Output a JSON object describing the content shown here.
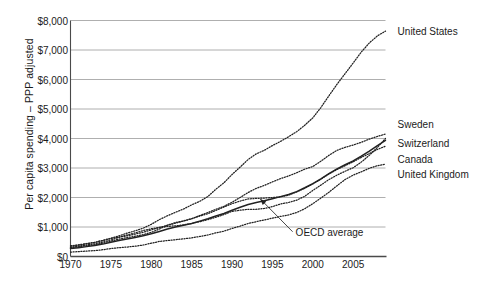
{
  "chart_data": {
    "type": "line",
    "title": "",
    "subtitle": "",
    "xlabel": "",
    "ylabel": "Per capita spending – PPP adjusted",
    "xlim": [
      1970,
      2009
    ],
    "ylim": [
      0,
      8000
    ],
    "grid": true,
    "legend_position": "right-inline-labels",
    "x_tick_labels": [
      "1970",
      "1975",
      "1980",
      "1985",
      "1990",
      "1995",
      "2000",
      "2005"
    ],
    "x_ticks": [
      1970,
      1975,
      1980,
      1985,
      1990,
      1995,
      2000,
      2005
    ],
    "y_tick_labels": [
      "$0",
      "$1,000",
      "$2,000",
      "$3,000",
      "$4,000",
      "$5,000",
      "$6,000",
      "$7,000",
      "$8,000"
    ],
    "y_ticks": [
      0,
      1000,
      2000,
      3000,
      4000,
      5000,
      6000,
      7000,
      8000
    ],
    "x": [
      1970,
      1971,
      1972,
      1973,
      1974,
      1975,
      1976,
      1977,
      1978,
      1979,
      1980,
      1981,
      1982,
      1983,
      1984,
      1985,
      1986,
      1987,
      1988,
      1989,
      1990,
      1991,
      1992,
      1993,
      1994,
      1995,
      1996,
      1997,
      1998,
      1999,
      2000,
      2001,
      2002,
      2003,
      2004,
      2005,
      2006,
      2007,
      2008,
      2009
    ],
    "annotations": [
      {
        "text": "OECD average",
        "target_x": 1993.5,
        "target_y": 1950,
        "label_x": 1997.5,
        "label_y": 840
      }
    ],
    "series": [
      {
        "name": "United States",
        "style": "dotted",
        "label_x": 2010.5,
        "label_y": 7660,
        "values": [
          360,
          395,
          440,
          480,
          545,
          620,
          700,
          790,
          870,
          960,
          1090,
          1250,
          1380,
          1500,
          1610,
          1750,
          1870,
          2030,
          2280,
          2500,
          2780,
          3030,
          3290,
          3480,
          3600,
          3760,
          3900,
          4060,
          4230,
          4450,
          4700,
          5050,
          5450,
          5840,
          6200,
          6560,
          6930,
          7240,
          7480,
          7640
        ]
      },
      {
        "name": "Sweden",
        "style": "dotted",
        "label_x": 2010.5,
        "label_y": 4480,
        "values": [
          310,
          350,
          390,
          430,
          490,
          560,
          650,
          730,
          800,
          880,
          940,
          990,
          1020,
          1040,
          1070,
          1120,
          1180,
          1250,
          1330,
          1420,
          1530,
          1570,
          1600,
          1600,
          1630,
          1690,
          1780,
          1830,
          1910,
          2040,
          2240,
          2420,
          2610,
          2760,
          2890,
          3010,
          3200,
          3430,
          3700,
          4000
        ]
      },
      {
        "name": "Switzerland",
        "style": "dotted",
        "label_x": 2010.5,
        "label_y": 3860,
        "values": [
          350,
          385,
          430,
          480,
          540,
          610,
          660,
          700,
          760,
          820,
          900,
          980,
          1060,
          1130,
          1200,
          1280,
          1390,
          1490,
          1600,
          1700,
          1840,
          2000,
          2170,
          2310,
          2410,
          2530,
          2640,
          2730,
          2840,
          2960,
          3050,
          3230,
          3430,
          3600,
          3700,
          3780,
          3870,
          3980,
          4070,
          4150
        ]
      },
      {
        "name": "Canada",
        "style": "dotted",
        "label_x": 2010.5,
        "label_y": 3320,
        "values": [
          300,
          330,
          365,
          400,
          455,
          520,
          590,
          640,
          690,
          740,
          820,
          930,
          1060,
          1150,
          1210,
          1280,
          1370,
          1450,
          1560,
          1680,
          1790,
          1880,
          1950,
          1970,
          1980,
          2000,
          2020,
          2080,
          2190,
          2310,
          2460,
          2620,
          2800,
          2950,
          3080,
          3210,
          3360,
          3490,
          3630,
          3740
        ]
      },
      {
        "name": "United Kingdom",
        "style": "dotted",
        "label_x": 2010.5,
        "label_y": 2790,
        "values": [
          150,
          165,
          185,
          200,
          230,
          270,
          300,
          320,
          350,
          390,
          450,
          510,
          540,
          570,
          600,
          630,
          680,
          730,
          800,
          860,
          950,
          1030,
          1120,
          1180,
          1240,
          1300,
          1360,
          1410,
          1490,
          1620,
          1790,
          1980,
          2180,
          2400,
          2610,
          2760,
          2870,
          2990,
          3080,
          3130
        ]
      },
      {
        "name": "OECD average",
        "style": "solid",
        "label_x": null,
        "label_y": null,
        "values": [
          270,
          300,
          335,
          370,
          420,
          480,
          540,
          590,
          645,
          700,
          770,
          850,
          930,
          1000,
          1060,
          1120,
          1200,
          1280,
          1370,
          1460,
          1570,
          1670,
          1760,
          1830,
          1890,
          1960,
          2030,
          2100,
          2200,
          2330,
          2470,
          2630,
          2810,
          2970,
          3110,
          3240,
          3400,
          3570,
          3760,
          3940
        ]
      }
    ]
  }
}
